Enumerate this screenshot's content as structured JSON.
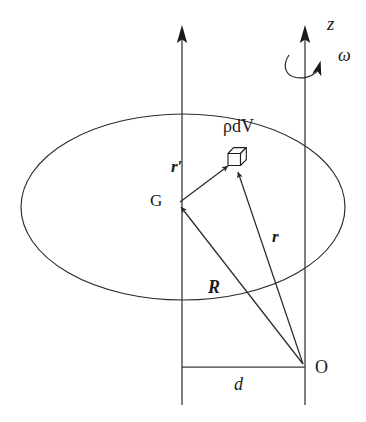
{
  "figure": {
    "background_color": "#ffffff",
    "stroke_color": "#2b2b2b",
    "text_color": "#1a1a1a",
    "width": 366,
    "height": 422
  },
  "labels": {
    "axis_z": "z",
    "angular_velocity": "ω",
    "mass_element": "ρdV",
    "vector_r_prime": "r′",
    "center_of_mass": "G",
    "vector_r": "r",
    "vector_R": "R",
    "origin": "O",
    "distance_d": "d"
  },
  "elements": {
    "body_outline": "ellipse",
    "axis_left": "vertical-line-through-G",
    "axis_right": "vertical-rotation-axis-z",
    "rotation_arc": "curved-arrow-around-z-axis",
    "mass_cube": "small-3d-cube",
    "baseline": "horizontal-segment-d"
  },
  "geometry": {
    "ellipse": {
      "cx": 183,
      "cy": 207,
      "rx": 162,
      "ry": 93
    },
    "point_G": {
      "x": 178,
      "y": 203
    },
    "point_O": {
      "x": 305,
      "y": 367
    },
    "point_mass": {
      "x": 233,
      "y": 163
    },
    "axis_left_x": 182,
    "axis_right_x": 305,
    "baseline_y": 367
  }
}
